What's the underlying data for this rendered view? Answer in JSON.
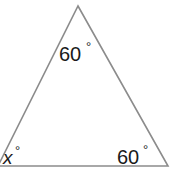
{
  "diagram": {
    "type": "triangle",
    "stroke_color": "#8c8c8c",
    "text_color": "#1a1a1a",
    "vertices": {
      "top": [
        78,
        6
      ],
      "bottom_left": [
        -2,
        166
      ],
      "bottom_right": [
        168,
        166
      ]
    },
    "angles": {
      "top": {
        "value": "60",
        "unit": "°"
      },
      "bottom_left": {
        "value": "x",
        "unit": "°"
      },
      "bottom_right": {
        "value": "60",
        "unit": "°"
      }
    }
  }
}
